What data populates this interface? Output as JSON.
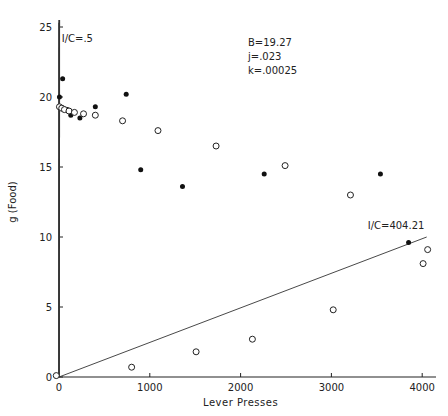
{
  "chart_data": {
    "type": "scatter",
    "title": "",
    "xlabel": "Lever Presses",
    "ylabel": "g (Food)",
    "xlim": [
      0,
      4100
    ],
    "ylim": [
      0,
      25
    ],
    "xticks": [
      0,
      1000,
      2000,
      3000,
      4000
    ],
    "yticks": [
      0,
      5,
      10,
      15,
      20,
      25
    ],
    "grid": false,
    "params": {
      "B": "B=19.27",
      "j": "j=.023",
      "k": "k=.00025"
    },
    "annotations": [
      {
        "text": "I/C=.5",
        "x": 30,
        "y": 23.9
      },
      {
        "text": "I/C=404.21",
        "x": 3400,
        "y": 10.6
      }
    ],
    "lines": [
      {
        "name": "I/C=.5",
        "points": [
          [
            0,
            0
          ],
          [
            2,
            25.5
          ]
        ]
      },
      {
        "name": "I/C=404.21",
        "points": [
          [
            0,
            0
          ],
          [
            4050,
            10.0
          ]
        ]
      }
    ],
    "series": [
      {
        "name": "obtained (filled)",
        "marker": "filled-circle",
        "points": [
          [
            5,
            20.0
          ],
          [
            40,
            21.3
          ],
          [
            50,
            19.2
          ],
          [
            90,
            19.1
          ],
          [
            130,
            18.7
          ],
          [
            230,
            18.5
          ],
          [
            400,
            19.3
          ],
          [
            740,
            20.2
          ],
          [
            900,
            14.8
          ],
          [
            1360,
            13.6
          ],
          [
            2260,
            14.5
          ],
          [
            3540,
            14.5
          ],
          [
            3850,
            9.6
          ]
        ]
      },
      {
        "name": "predicted (open)",
        "marker": "open-circle",
        "points": [
          [
            -30,
            0.1
          ],
          [
            5,
            19.3
          ],
          [
            30,
            19.2
          ],
          [
            60,
            19.1
          ],
          [
            110,
            19.0
          ],
          [
            170,
            18.9
          ],
          [
            270,
            18.8
          ],
          [
            400,
            18.7
          ],
          [
            700,
            18.3
          ],
          [
            1090,
            17.6
          ],
          [
            1730,
            16.5
          ],
          [
            2490,
            15.1
          ],
          [
            3210,
            13.0
          ],
          [
            4060,
            9.1
          ],
          [
            4010,
            8.1
          ],
          [
            3020,
            4.8
          ],
          [
            2130,
            2.7
          ],
          [
            1510,
            1.8
          ],
          [
            800,
            0.7
          ]
        ]
      }
    ]
  }
}
